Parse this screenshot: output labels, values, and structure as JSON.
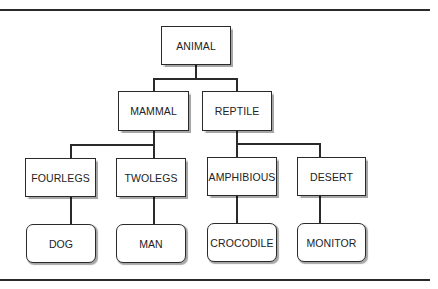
{
  "diagram": {
    "type": "tree",
    "root": "ANIMAL",
    "levels": [
      [
        "ANIMAL"
      ],
      [
        "MAMMAL",
        "REPTILE"
      ],
      [
        "FOURLEGS",
        "TWOLEGS",
        "AMPHIBIOUS",
        "DESERT"
      ],
      [
        "DOG",
        "MAN",
        "CROCODILE",
        "MONITOR"
      ]
    ],
    "nodes": {
      "animal": "ANIMAL",
      "mammal": "MAMMAL",
      "reptile": "REPTILE",
      "fourlegs": "FOURLEGS",
      "twolegs": "TWOLEGS",
      "amphibious": "AMPHIBIOUS",
      "desert": "DESERT",
      "dog": "DOG",
      "man": "MAN",
      "crocodile": "CROCODILE",
      "monitor": "MONITOR"
    },
    "edges": [
      [
        "ANIMAL",
        "MAMMAL"
      ],
      [
        "ANIMAL",
        "REPTILE"
      ],
      [
        "MAMMAL",
        "FOURLEGS"
      ],
      [
        "MAMMAL",
        "TWOLEGS"
      ],
      [
        "REPTILE",
        "AMPHIBIOUS"
      ],
      [
        "REPTILE",
        "DESERT"
      ],
      [
        "FOURLEGS",
        "DOG"
      ],
      [
        "TWOLEGS",
        "MAN"
      ],
      [
        "AMPHIBIOUS",
        "CROCODILE"
      ],
      [
        "DESERT",
        "MONITOR"
      ]
    ]
  }
}
